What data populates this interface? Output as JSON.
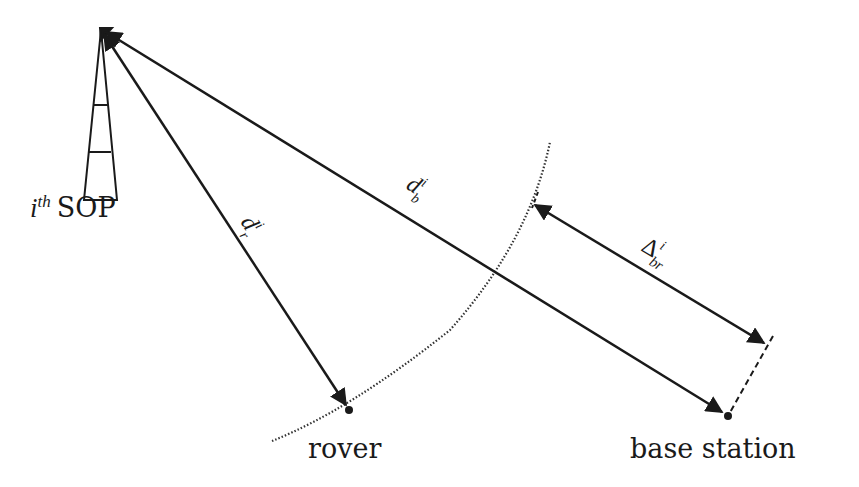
{
  "diagram": {
    "type": "geometry-schematic",
    "colors": {
      "stroke": "#1a1a1a",
      "background": "#ffffff"
    },
    "nodes": {
      "sop": {
        "label_prefix": "i",
        "label_sup": "th",
        "label_suffix": "SOP",
        "icon": "tower-icon"
      },
      "rover": {
        "label": "rover"
      },
      "base_station": {
        "label": "base station"
      }
    },
    "edges": {
      "d_r": {
        "symbol": "d",
        "sub": "r",
        "sup": "i",
        "from": "sop",
        "to": "rover"
      },
      "d_b": {
        "symbol": "d",
        "sub": "b",
        "sup": "i",
        "from": "sop",
        "to": "base_station"
      },
      "delta_br": {
        "symbol": "Δ",
        "sub": "br",
        "sup": "i",
        "type": "double-arrow"
      }
    },
    "annotations": {
      "arc": "dotted circular arc through rover (radius d_r)",
      "dashed": "dashed perpendicular at base station end"
    }
  }
}
